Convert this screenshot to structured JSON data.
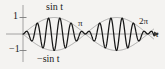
{
  "figure": {
    "background_color": "#f4f3f1",
    "ink_color": "#1a1a1a",
    "envelope_color": "#8a8a8a",
    "axis_color": "#9a9a9a"
  },
  "labels": {
    "upper_envelope": "sin t",
    "lower_envelope": "−sin t",
    "tick_pi": "π",
    "tick_two_pi": "2π",
    "axis_t": "t",
    "y_one": "1",
    "y_neg_one": "−1"
  },
  "chart_data": {
    "type": "line",
    "title": "",
    "xlabel": "t",
    "ylabel": "",
    "xlim": [
      0,
      6.6
    ],
    "ylim": [
      -1.25,
      1.25
    ],
    "grid": false,
    "legend": "annotations",
    "x_ticks": [
      {
        "value": 3.14159,
        "label": "π"
      },
      {
        "value": 6.28319,
        "label": "2π"
      }
    ],
    "y_ticks": [
      {
        "value": 1,
        "label": "1"
      },
      {
        "value": -1,
        "label": "−1"
      }
    ],
    "annotations": [
      {
        "text": "sin t",
        "x": 1.55,
        "y": 1.18
      },
      {
        "text": "−sin t",
        "x": 1.4,
        "y": -1.18
      },
      {
        "text": "π",
        "x": 3.14159,
        "y": 0.42
      },
      {
        "text": "2π",
        "x": 6.1,
        "y": 0.52
      },
      {
        "text": "t",
        "x": 6.55,
        "y": -0.08
      }
    ],
    "series": [
      {
        "name": "upper envelope",
        "style": "thin",
        "formula": "y = sin(t)",
        "samples": 400
      },
      {
        "name": "lower envelope",
        "style": "thin",
        "formula": "y = -sin(t)",
        "samples": 400
      },
      {
        "name": "modulated wave",
        "style": "thick",
        "formula": "y = sin(t) * sin(11*t)",
        "frequency": 11,
        "samples": 1600
      }
    ]
  }
}
